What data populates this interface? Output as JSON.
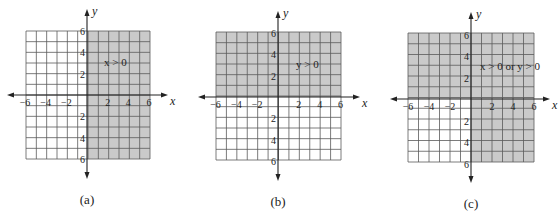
{
  "colors": {
    "shade": "#cacaca",
    "grid_line": "#5a5a5a",
    "axis": "#222222",
    "background": "#ffffff"
  },
  "panels": [
    {
      "id": "a",
      "label": "(a)",
      "inequality": "x > 0",
      "region": "x>0",
      "grid": {
        "left": 26,
        "top": 31,
        "right": 150,
        "bottom": 159
      },
      "origin": {
        "x": 87,
        "y": 95
      },
      "x_axis": {
        "from": 7,
        "to": 168
      },
      "y_axis": {
        "from": 9,
        "to": 179
      },
      "annotation_pos": {
        "x": 104,
        "y": 66
      },
      "label_pos": {
        "x": 87,
        "y": 204
      }
    },
    {
      "id": "b",
      "label": "(b)",
      "inequality": "y > 0",
      "region": "y>0",
      "grid": {
        "left": 216,
        "top": 32,
        "right": 341,
        "bottom": 160
      },
      "origin": {
        "x": 278,
        "y": 97
      },
      "x_axis": {
        "from": 198,
        "to": 360
      },
      "y_axis": {
        "from": 11,
        "to": 181
      },
      "annotation_pos": {
        "x": 296,
        "y": 68
      },
      "label_pos": {
        "x": 278,
        "y": 206
      }
    },
    {
      "id": "c",
      "label": "(c)",
      "inequality": "x > 0 or y > 0",
      "region": "x>0 or y>0",
      "grid": {
        "left": 408,
        "top": 33,
        "right": 534,
        "bottom": 162
      },
      "origin": {
        "x": 471,
        "y": 99
      },
      "x_axis": {
        "from": 390,
        "to": 550
      },
      "y_axis": {
        "from": 12,
        "to": 183
      },
      "annotation_pos": {
        "x": 480,
        "y": 70
      },
      "label_pos": {
        "x": 471,
        "y": 208
      }
    }
  ],
  "axes": {
    "x_label": "x",
    "y_label": "y",
    "x_ticks": [
      "−6",
      "−4",
      "−2",
      "2",
      "4",
      "6"
    ],
    "x_tick_values": [
      -6,
      -4,
      -2,
      2,
      4,
      6
    ],
    "y_ticks": [
      "6",
      "4",
      "2",
      "2",
      "4",
      "6"
    ],
    "y_tick_values": [
      6,
      4,
      2,
      -2,
      -4,
      -6
    ],
    "range": [
      -6,
      6
    ],
    "cells_per_side": 12
  }
}
